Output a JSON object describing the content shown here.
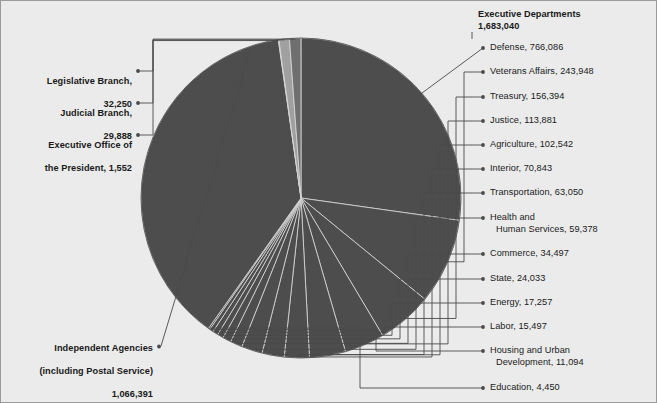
{
  "chart_data": {
    "type": "pie",
    "total": 2813121,
    "legend_position": "callout-labels",
    "grid": false,
    "categories": [
      "Executive Departments",
      "Independent Agencies (including Postal Service)",
      "Legislative Branch",
      "Judicial Branch",
      "Executive Office of the President"
    ],
    "values": [
      1683040,
      1066391,
      32250,
      29888,
      1552
    ],
    "breakdown_label": "Executive Departments",
    "breakdown_categories": [
      "Defense",
      "Veterans Affairs",
      "Treasury",
      "Justice",
      "Agriculture",
      "Interior",
      "Transportation",
      "Health and Human Services",
      "Commerce",
      "State",
      "Energy",
      "Labor",
      "Housing and Urban Development",
      "Education"
    ],
    "breakdown_values": [
      766086,
      243948,
      156394,
      113881,
      102542,
      70843,
      63050,
      59378,
      34497,
      24033,
      17257,
      15497,
      11094,
      4450
    ],
    "xlabel": "",
    "ylabel": ""
  },
  "colors": {
    "background": "#ebebeb",
    "slice_major": "#4d4d4d",
    "slice_minor_light": "#a0a0a0",
    "slice_minor_mid": "#6f6f6f",
    "slice_divider": "#d9d9d9",
    "leader_line": "#4a4a4a",
    "text": "#1a1a1a",
    "border": "#9a9a9a"
  },
  "header": {
    "group_title": "Executive Departments",
    "group_value": "1,683,040"
  },
  "left_labels": [
    {
      "id": "legislative-branch",
      "line1": "Legislative Branch,",
      "line2": "32,250"
    },
    {
      "id": "judicial-branch",
      "line1": "Judicial Branch,",
      "line2": "29,888"
    },
    {
      "id": "executive-office",
      "line1": "Executive Office of",
      "line2": "the President, 1,552"
    }
  ],
  "independent_agencies": {
    "line1": "Independent Agencies",
    "line2": "(including Postal Service)",
    "line3": "1,066,391"
  },
  "right_labels": [
    {
      "id": "defense",
      "line1": "Defense, 766,086",
      "line2": ""
    },
    {
      "id": "veterans",
      "line1": "Veterans Affairs, 243,948",
      "line2": ""
    },
    {
      "id": "treasury",
      "line1": "Treasury, 156,394",
      "line2": ""
    },
    {
      "id": "justice",
      "line1": "Justice, 113,881",
      "line2": ""
    },
    {
      "id": "agriculture",
      "line1": "Agriculture, 102,542",
      "line2": ""
    },
    {
      "id": "interior",
      "line1": "Interior, 70,843",
      "line2": ""
    },
    {
      "id": "transportation",
      "line1": "Transportation, 63,050",
      "line2": ""
    },
    {
      "id": "hhs",
      "line1": "Health and",
      "line2": "Human Services, 59,378"
    },
    {
      "id": "commerce",
      "line1": "Commerce, 34,497",
      "line2": ""
    },
    {
      "id": "state",
      "line1": "State, 24,033",
      "line2": ""
    },
    {
      "id": "energy",
      "line1": "Energy, 17,257",
      "line2": ""
    },
    {
      "id": "labor",
      "line1": "Labor, 15,497",
      "line2": ""
    },
    {
      "id": "hud",
      "line1": "Housing and Urban",
      "line2": "Development, 11,094"
    },
    {
      "id": "education",
      "line1": "Education, 4,450",
      "line2": ""
    }
  ]
}
